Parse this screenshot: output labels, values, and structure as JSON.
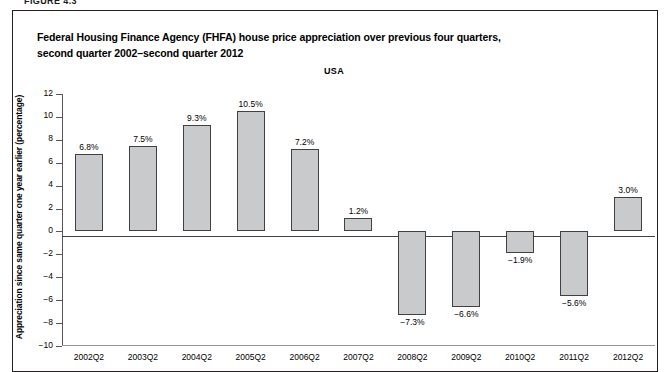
{
  "figure": {
    "number_label": "FIGURE 4.3",
    "frame_border_color": "#231f20"
  },
  "chart_data": {
    "type": "bar",
    "title": "Federal Housing Finance Agency (FHFA) house price appreciation over previous four quarters, second quarter 2002–second quarter 2012",
    "title_line1": "Federal Housing Finance Agency (FHFA) house price appreciation over previous four quarters,",
    "title_line2": "second quarter 2002–second quarter 2012",
    "series_label": "USA",
    "xlabel": "",
    "ylabel": "Appreciation since same quarter one year earlier (percentage)",
    "categories": [
      "2002Q2",
      "2003Q2",
      "2004Q2",
      "2005Q2",
      "2006Q2",
      "2007Q2",
      "2008Q2",
      "2009Q2",
      "2010Q2",
      "2011Q2",
      "2012Q2"
    ],
    "values": [
      6.8,
      7.5,
      9.3,
      10.5,
      7.2,
      1.2,
      -7.3,
      -6.6,
      -1.9,
      -5.6,
      3.0
    ],
    "value_labels": [
      "6.8%",
      "7.5%",
      "9.3%",
      "10.5%",
      "7.2%",
      "1.2%",
      "−7.3%",
      "−6.6%",
      "−1.9%",
      "−5.6%",
      "3.0%"
    ],
    "ylim": [
      -10,
      12
    ],
    "ytick_values": [
      12,
      10,
      8,
      6,
      4,
      2,
      0,
      -2,
      -4,
      -6,
      -8,
      -10
    ],
    "ytick_labels": [
      "12",
      "10",
      "8",
      "6",
      "4",
      "2",
      "0",
      "−2",
      "−4",
      "−6",
      "−8",
      "−10"
    ],
    "grid": false,
    "legend_position": "none",
    "bar_fill_color": "#c9cacb",
    "bar_border_color": "#414042",
    "axis_color": "#58595b"
  }
}
